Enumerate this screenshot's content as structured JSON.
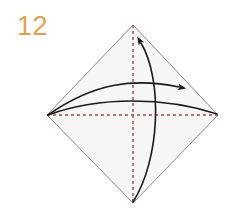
{
  "figure": {
    "kind": "origami-fold-step-diagram",
    "step_number": "12",
    "step_number_color": "#e2a152",
    "background_color": "#ffffff",
    "canvas": {
      "width": 236,
      "height": 211
    }
  },
  "shape": {
    "name": "square-rotated-45-diamond",
    "fill_color": "#f7f7f5",
    "stroke_color": "#8d8a86",
    "stroke_width": 1,
    "vertices": {
      "top": {
        "x": 133,
        "y": 25
      },
      "right": {
        "x": 218,
        "y": 115
      },
      "bottom": {
        "x": 133,
        "y": 203
      },
      "left": {
        "x": 47,
        "y": 115
      }
    },
    "path": "M133,25 L218,115 L133,203 L47,115 Z"
  },
  "fold_lines": [
    {
      "name": "vertical-valley-fold-line",
      "style": "dashed",
      "color": "#b2423f",
      "stroke_width": 1.4,
      "dash": "3,3",
      "from": {
        "x": 133,
        "y": 25
      },
      "to": {
        "x": 133,
        "y": 203
      }
    },
    {
      "name": "horizontal-valley-fold-line",
      "style": "dashed",
      "color": "#b2423f",
      "stroke_width": 1.4,
      "dash": "3,3",
      "from": {
        "x": 47,
        "y": 115
      },
      "to": {
        "x": 218,
        "y": 115
      }
    }
  ],
  "fold_arrows": [
    {
      "name": "horizontal-fold-arrow",
      "direction": "left-to-right",
      "color": "#1a1a1a",
      "stroke_width": 1.6,
      "path": "M48,115 C95,82 135,78 179,87",
      "arrowhead": {
        "x": 180,
        "y": 88,
        "angle_deg": 14
      }
    },
    {
      "name": "vertical-fold-arrow",
      "direction": "bottom-to-top",
      "color": "#1a1a1a",
      "stroke_width": 1.6,
      "path": "M133,202 C160,160 163,80 141,43",
      "arrowhead": {
        "x": 140,
        "y": 42,
        "angle_deg": -117
      }
    }
  ],
  "fold_return_curve": {
    "name": "fold-return-curve",
    "color": "#1a1a1a",
    "stroke_width": 1.4,
    "path": "M48,115 C100,96 165,97 217,114"
  },
  "labels": {
    "step_label": "12"
  }
}
